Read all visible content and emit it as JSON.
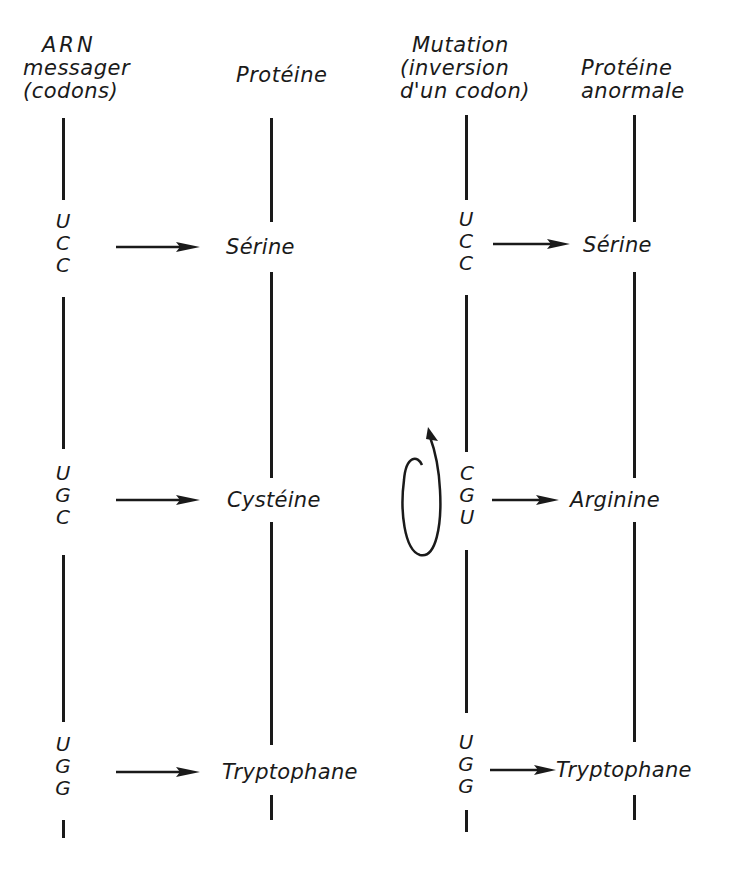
{
  "diagram": {
    "type": "genetic-code-mutation",
    "colors": {
      "ink": "#1a1a1a",
      "background": "#ffffff"
    },
    "columns": [
      {
        "id": "arn",
        "header": [
          "ARN",
          "messager",
          "(codons)"
        ]
      },
      {
        "id": "proteine",
        "header": [
          "Protéine"
        ]
      },
      {
        "id": "mutation",
        "header": [
          "Mutation",
          "(inversion",
          "d'un codon)"
        ]
      },
      {
        "id": "proteine-anormale",
        "header": [
          "Protéine",
          "anormale"
        ]
      }
    ],
    "rows": [
      {
        "normal_codon": [
          "U",
          "C",
          "C"
        ],
        "normal_amino_acid": "Sérine",
        "mutant_codon": [
          "U",
          "C",
          "C"
        ],
        "mutant_amino_acid": "Sérine"
      },
      {
        "normal_codon": [
          "U",
          "G",
          "C"
        ],
        "normal_amino_acid": "Cystéine",
        "mutant_codon": [
          "C",
          "G",
          "U"
        ],
        "mutant_amino_acid": "Arginine",
        "inverted": true
      },
      {
        "normal_codon": [
          "U",
          "G",
          "G"
        ],
        "normal_amino_acid": "Tryptophane",
        "mutant_codon": [
          "U",
          "G",
          "G"
        ],
        "mutant_amino_acid": "Tryptophane"
      }
    ],
    "icons": {
      "arrow": "right-arrow",
      "inversion": "circular-rotation-arrow"
    }
  }
}
